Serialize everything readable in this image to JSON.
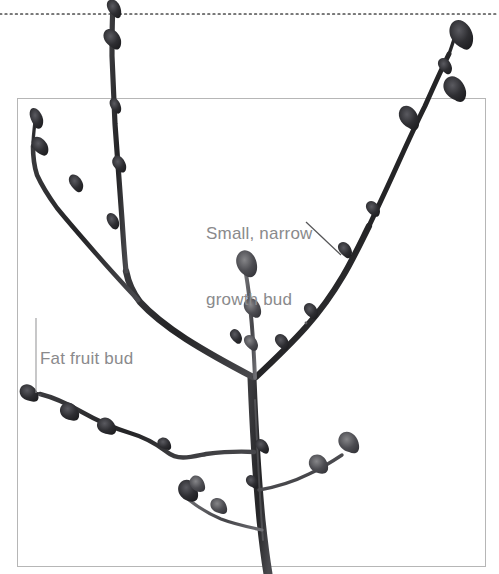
{
  "figure": {
    "width": 499,
    "height": 574,
    "background_color": "#ffffff",
    "style": "black-and-white botanical photo illustration"
  },
  "frame": {
    "name": "image-border-rectangle",
    "x": 17,
    "y": 98,
    "width": 469,
    "height": 469,
    "stroke_color": "#b3b3b3",
    "stroke_width": 1
  },
  "dotted_rule": {
    "name": "top-dotted-divider",
    "y": 14,
    "x_start": 0,
    "x_end": 499,
    "dot_color": "#4d4d4d",
    "dot_size": 1.6,
    "dot_gap": 5
  },
  "annotations": [
    {
      "id": "growth-bud",
      "lines": [
        "Small, narrow",
        "growth bud"
      ],
      "text": "Small, narrow growth bud",
      "text_color": "#8a8a8c",
      "font_size_px": 17,
      "x": 206,
      "y": 179,
      "leader": {
        "name": "growth-bud-leader-line",
        "x1": 306,
        "y1": 222,
        "x2": 341,
        "y2": 255,
        "stroke_color": "#555557",
        "stroke_width": 1.2
      }
    },
    {
      "id": "fruit-bud",
      "lines": [
        "Fat fruit bud"
      ],
      "text": "Fat fruit bud",
      "text_color": "#8a8a8c",
      "font_size_px": 17,
      "x": 40,
      "y": 304,
      "leader": {
        "name": "fruit-bud-leader-line",
        "x1": 36,
        "y1": 318,
        "x2": 36,
        "y2": 393,
        "stroke_color": "#9a9a9c",
        "stroke_width": 1.1
      }
    }
  ],
  "branch_colors": {
    "bark_dark": "#2b2b2d",
    "bark_mid": "#3c3c3f",
    "bark_light": "#6f6f73",
    "bud_dark": "#222224",
    "bud_mid": "#45454a"
  },
  "branch_structure": {
    "junction_main": {
      "x": 255,
      "y": 380
    },
    "trunk": {
      "from": {
        "x": 255,
        "y": 380
      },
      "to": {
        "x": 269,
        "y": 574
      }
    },
    "left_limb_tip": {
      "x": 35,
      "y": 116
    },
    "right_limb_tip": {
      "x": 455,
      "y": 30
    },
    "upper_center_tip": {
      "x": 113,
      "y": 8
    },
    "center_spur_tip": {
      "x": 245,
      "y": 264
    },
    "lower_left_branch_tip": {
      "x": 30,
      "y": 393
    },
    "lower_right_branch_tip": {
      "x": 352,
      "y": 444
    },
    "bottom_left_spur_tip": {
      "x": 183,
      "y": 495
    }
  },
  "bud_counts": {
    "fat_fruit_buds": 6,
    "narrow_growth_buds": 11
  }
}
